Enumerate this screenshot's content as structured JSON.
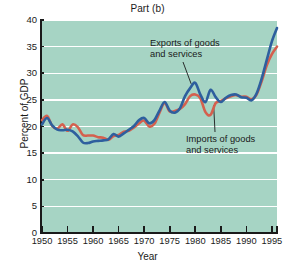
{
  "chart_data": {
    "type": "line",
    "title": "Part (b)",
    "xlabel": "Year",
    "ylabel": "Percent of GDP",
    "xlim": [
      1950,
      1996
    ],
    "ylim": [
      0,
      40
    ],
    "yticks": [
      0,
      5,
      10,
      15,
      20,
      25,
      30,
      35,
      40
    ],
    "xticks": [
      1950,
      1955,
      1960,
      1965,
      1970,
      1975,
      1980,
      1985,
      1990,
      1995
    ],
    "grid": "horizontal",
    "legend": "annotations",
    "annotations": [
      {
        "name": "exports-annotation",
        "text": "Exports of goods\nand services",
        "points_to_series": "Exports of goods and services"
      },
      {
        "name": "imports-annotation",
        "text": "Imports of goods\nand services",
        "points_to_series": "Imports of goods and services"
      }
    ],
    "colors": {
      "exports": "#2e5f9e",
      "imports": "#d4604e",
      "plot_background": "#a6d4c4",
      "gridline": "#ffffff",
      "axis": "#1a1a1a",
      "figure_background": "#ffffff"
    },
    "x": [
      1950,
      1951,
      1952,
      1953,
      1954,
      1955,
      1956,
      1957,
      1958,
      1959,
      1960,
      1961,
      1962,
      1963,
      1964,
      1965,
      1966,
      1967,
      1968,
      1969,
      1970,
      1971,
      1972,
      1973,
      1974,
      1975,
      1976,
      1977,
      1978,
      1979,
      1980,
      1981,
      1982,
      1983,
      1984,
      1985,
      1986,
      1987,
      1988,
      1989,
      1990,
      1991,
      1992,
      1993,
      1994,
      1995,
      1996
    ],
    "series": [
      {
        "name": "Exports of goods and services",
        "color": "#2e5f9e",
        "values": [
          20.4,
          21.6,
          20.2,
          19.4,
          19.3,
          19.4,
          19.1,
          18.2,
          17.0,
          16.9,
          17.2,
          17.3,
          17.4,
          17.6,
          18.6,
          18.1,
          18.7,
          19.4,
          20.1,
          21.2,
          21.6,
          20.6,
          21.2,
          23.0,
          24.6,
          23.0,
          22.6,
          23.4,
          25.7,
          27.2,
          28.2,
          26.0,
          24.6,
          26.9,
          25.5,
          24.6,
          25.4,
          25.9,
          26.0,
          25.5,
          25.4,
          24.9,
          26.2,
          29.0,
          32.5,
          36.0,
          38.5
        ]
      },
      {
        "name": "Imports of goods and services",
        "color": "#d4604e",
        "values": [
          21.2,
          22.0,
          20.1,
          19.6,
          20.4,
          19.2,
          20.4,
          19.9,
          18.4,
          18.3,
          18.3,
          18.0,
          17.9,
          17.5,
          18.2,
          18.4,
          19.0,
          19.2,
          19.8,
          20.6,
          21.1,
          20.0,
          20.5,
          22.6,
          24.4,
          22.8,
          22.9,
          23.3,
          24.2,
          25.7,
          26.0,
          25.3,
          22.7,
          22.2,
          24.4,
          24.8,
          25.3,
          25.7,
          25.9,
          25.6,
          25.6,
          25.1,
          26.0,
          28.5,
          31.5,
          33.6,
          35.0
        ]
      }
    ]
  }
}
